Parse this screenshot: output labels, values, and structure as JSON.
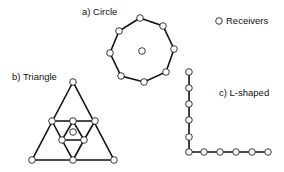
{
  "labels": {
    "circle": "a) Circle",
    "triangle": "b) Triangle",
    "lshaped": "c) L-shaped",
    "legend": "Receivers"
  },
  "legend": {
    "symbol": "receiver-circle",
    "label": "Receivers"
  },
  "colors": {
    "line": "#111111",
    "node_fill": "#ffffff",
    "node_stroke": "#222222"
  },
  "arrays": [
    {
      "name": "circle",
      "perimeter_receivers": 8,
      "center_receivers": 1
    },
    {
      "name": "triangle",
      "receivers": 10
    },
    {
      "name": "lshaped",
      "vertical_receivers": 6,
      "horizontal_receivers": 6,
      "shared_corner": true
    }
  ]
}
